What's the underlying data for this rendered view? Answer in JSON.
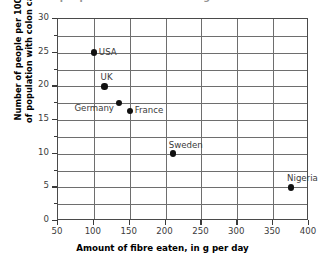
{
  "chart_data": {
    "type": "scatter",
    "title": "Number of people with colon cancer against amount of fibre eaten",
    "xlabel": "Amount of fibre eaten, in g per day",
    "ylabel": "Number of people per 100 000 of population with colon cancer",
    "ylabel_lines": [
      "Number of people per 100 000",
      "of population with colon cancer"
    ],
    "xlim": [
      50,
      400
    ],
    "ylim": [
      0,
      30
    ],
    "xticks": [
      50,
      100,
      150,
      200,
      250,
      300,
      350,
      400
    ],
    "yticks": [
      0,
      5,
      10,
      15,
      20,
      25,
      30
    ],
    "y_minor_step": 2.5,
    "grid": true,
    "legend": "none",
    "marker": "filled-circle",
    "marker_color": "#111111",
    "grid_color": "#6e6e6e",
    "axis_color": "#4a4a4a",
    "background": "#ffffff",
    "points": [
      {
        "label": "USA",
        "x": 100,
        "y": 25.0,
        "label_pos": "right"
      },
      {
        "label": "UK",
        "x": 115,
        "y": 20.0,
        "label_pos": "above"
      },
      {
        "label": "Germany",
        "x": 135,
        "y": 17.5,
        "label_pos": "left"
      },
      {
        "label": "France",
        "x": 150,
        "y": 16.3,
        "label_pos": "right"
      },
      {
        "label": "Sweden",
        "x": 210,
        "y": 10.0,
        "label_pos": "above"
      },
      {
        "label": "Nigeria",
        "x": 375,
        "y": 5.0,
        "label_pos": "above"
      }
    ]
  }
}
